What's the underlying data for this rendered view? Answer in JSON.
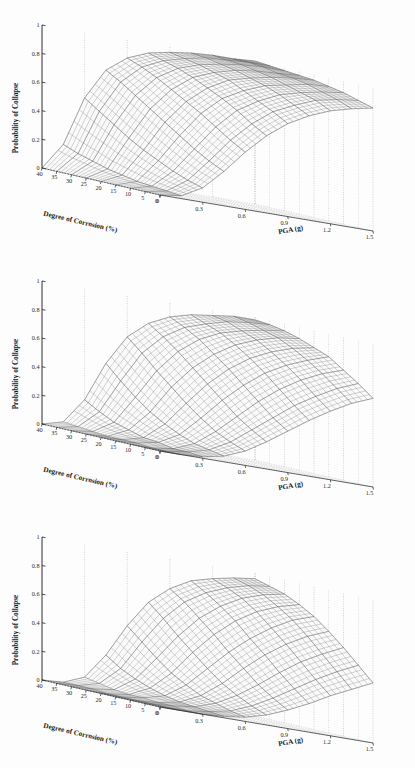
{
  "figure": {
    "background": "#fdfdfd",
    "panel_count": 3,
    "panel_height": 256
  },
  "axes_common": {
    "z": {
      "label": "Probability of Collapse",
      "ticks": [
        "0",
        "0.2",
        "0.4",
        "0.6",
        "0.8",
        "1"
      ],
      "tick_values": [
        0,
        0.2,
        0.4,
        0.6,
        0.8,
        1
      ],
      "range": [
        0,
        1
      ]
    },
    "x": {
      "label": "Degree of Corrosion (%)",
      "ticks": [
        "40",
        "35",
        "30",
        "25",
        "20",
        "15",
        "10",
        "5",
        "0"
      ],
      "tick_values": [
        40,
        35,
        30,
        25,
        20,
        15,
        10,
        5,
        0
      ],
      "range": [
        0,
        40
      ],
      "direction": "reversed"
    },
    "y": {
      "label": "PGA (g)",
      "ticks": [
        "0",
        "0.3",
        "0.6",
        "0.9",
        "1.2",
        "1.5"
      ],
      "tick_values": [
        0,
        0.3,
        0.6,
        0.9,
        1.2,
        1.5
      ],
      "range": [
        0,
        1.5
      ]
    },
    "colors": {
      "mesh_line": "#6d6d6d",
      "mesh_line_light": "#b9b9b9",
      "axis_line": "#222222",
      "grid_dotted": "#8a8a8a",
      "surface_fill": "#fafafa"
    }
  },
  "chart_data": [
    {
      "id": "panel-1",
      "type": "surface",
      "title": "",
      "xlabel": "Degree of Corrosion (%)",
      "ylabel": "PGA (g)",
      "zlabel": "Probability of Collapse",
      "xlim": [
        0,
        40
      ],
      "ylim": [
        0,
        1.5
      ],
      "zlim": [
        0,
        1
      ],
      "grid": true,
      "legend": "none",
      "x": [
        0,
        5,
        10,
        15,
        20,
        25,
        30,
        35,
        40
      ],
      "y": [
        0,
        0.15,
        0.3,
        0.45,
        0.6,
        0.75,
        0.9,
        1.05,
        1.2,
        1.35,
        1.5
      ],
      "description": "Collapse fragility surface, lowest PGA threshold; probability rises steeply and saturates near 1 at high corrosion.",
      "z": [
        [
          0.0,
          0.02,
          0.1,
          0.24,
          0.4,
          0.54,
          0.65,
          0.73,
          0.79,
          0.83,
          0.86
        ],
        [
          0.0,
          0.03,
          0.13,
          0.29,
          0.46,
          0.6,
          0.71,
          0.78,
          0.84,
          0.87,
          0.89
        ],
        [
          0.0,
          0.04,
          0.17,
          0.35,
          0.53,
          0.67,
          0.76,
          0.83,
          0.87,
          0.9,
          0.92
        ],
        [
          0.0,
          0.05,
          0.22,
          0.42,
          0.6,
          0.73,
          0.81,
          0.87,
          0.9,
          0.93,
          0.94
        ],
        [
          0.0,
          0.07,
          0.27,
          0.49,
          0.66,
          0.78,
          0.86,
          0.9,
          0.93,
          0.95,
          0.96
        ],
        [
          0.0,
          0.09,
          0.33,
          0.56,
          0.72,
          0.83,
          0.89,
          0.93,
          0.95,
          0.96,
          0.97
        ],
        [
          0.0,
          0.12,
          0.4,
          0.63,
          0.78,
          0.87,
          0.92,
          0.95,
          0.97,
          0.98,
          0.98
        ],
        [
          0.0,
          0.15,
          0.47,
          0.7,
          0.83,
          0.9,
          0.94,
          0.97,
          0.98,
          0.99,
          0.99
        ],
        [
          0.0,
          0.19,
          0.54,
          0.76,
          0.87,
          0.93,
          0.96,
          0.98,
          0.99,
          0.99,
          1.0
        ]
      ]
    },
    {
      "id": "panel-2",
      "type": "surface",
      "title": "",
      "xlabel": "Degree of Corrosion (%)",
      "ylabel": "PGA (g)",
      "zlabel": "Probability of Collapse",
      "xlim": [
        0,
        40
      ],
      "ylim": [
        0,
        1.5
      ],
      "zlim": [
        0,
        1
      ],
      "grid": true,
      "legend": "none",
      "x": [
        0,
        5,
        10,
        15,
        20,
        25,
        30,
        35,
        40
      ],
      "y": [
        0,
        0.15,
        0.3,
        0.45,
        0.6,
        0.75,
        0.9,
        1.05,
        1.2,
        1.35,
        1.5
      ],
      "description": "Collapse fragility surface, intermediate PGA threshold; onset delayed relative to panel 1.",
      "z": [
        [
          0.0,
          0.0,
          0.01,
          0.04,
          0.1,
          0.19,
          0.29,
          0.39,
          0.48,
          0.56,
          0.62
        ],
        [
          0.0,
          0.0,
          0.02,
          0.06,
          0.14,
          0.25,
          0.36,
          0.47,
          0.56,
          0.64,
          0.7
        ],
        [
          0.0,
          0.0,
          0.02,
          0.08,
          0.19,
          0.32,
          0.45,
          0.56,
          0.65,
          0.72,
          0.77
        ],
        [
          0.0,
          0.01,
          0.04,
          0.12,
          0.26,
          0.41,
          0.54,
          0.65,
          0.73,
          0.79,
          0.84
        ],
        [
          0.0,
          0.01,
          0.05,
          0.17,
          0.34,
          0.5,
          0.63,
          0.73,
          0.8,
          0.85,
          0.88
        ],
        [
          0.0,
          0.01,
          0.08,
          0.23,
          0.43,
          0.59,
          0.71,
          0.8,
          0.86,
          0.9,
          0.92
        ],
        [
          0.0,
          0.02,
          0.11,
          0.31,
          0.52,
          0.68,
          0.79,
          0.86,
          0.9,
          0.93,
          0.95
        ],
        [
          0.0,
          0.03,
          0.16,
          0.4,
          0.62,
          0.76,
          0.85,
          0.9,
          0.94,
          0.96,
          0.97
        ],
        [
          0.0,
          0.04,
          0.22,
          0.5,
          0.71,
          0.83,
          0.9,
          0.94,
          0.96,
          0.98,
          0.98
        ]
      ]
    },
    {
      "id": "panel-3",
      "type": "surface",
      "title": "",
      "xlabel": "Degree of Corrosion (%)",
      "ylabel": "PGA (g)",
      "zlabel": "Probability of Collapse",
      "xlim": [
        0,
        40
      ],
      "ylim": [
        0,
        1.5
      ],
      "zlim": [
        0,
        1
      ],
      "grid": true,
      "legend": "none",
      "x": [
        0,
        5,
        10,
        15,
        20,
        25,
        30,
        35,
        40
      ],
      "y": [
        0,
        0.15,
        0.3,
        0.45,
        0.6,
        0.75,
        0.9,
        1.05,
        1.2,
        1.35,
        1.5
      ],
      "description": "Collapse fragility surface, highest PGA threshold; lowest probabilities, narrow ridge at the far corner.",
      "z": [
        [
          0.0,
          0.0,
          0.0,
          0.01,
          0.03,
          0.07,
          0.13,
          0.2,
          0.28,
          0.35,
          0.42
        ],
        [
          0.0,
          0.0,
          0.0,
          0.02,
          0.05,
          0.11,
          0.19,
          0.28,
          0.37,
          0.45,
          0.52
        ],
        [
          0.0,
          0.0,
          0.01,
          0.03,
          0.08,
          0.16,
          0.26,
          0.37,
          0.47,
          0.55,
          0.62
        ],
        [
          0.0,
          0.0,
          0.01,
          0.04,
          0.11,
          0.22,
          0.35,
          0.47,
          0.57,
          0.65,
          0.71
        ],
        [
          0.0,
          0.0,
          0.02,
          0.06,
          0.16,
          0.3,
          0.44,
          0.56,
          0.66,
          0.74,
          0.79
        ],
        [
          0.0,
          0.0,
          0.02,
          0.09,
          0.22,
          0.39,
          0.54,
          0.66,
          0.75,
          0.81,
          0.85
        ],
        [
          0.0,
          0.01,
          0.03,
          0.13,
          0.3,
          0.48,
          0.63,
          0.74,
          0.82,
          0.87,
          0.9
        ],
        [
          0.0,
          0.01,
          0.05,
          0.18,
          0.39,
          0.58,
          0.72,
          0.81,
          0.87,
          0.91,
          0.93
        ],
        [
          0.0,
          0.01,
          0.07,
          0.25,
          0.48,
          0.67,
          0.79,
          0.87,
          0.91,
          0.94,
          0.96
        ]
      ]
    }
  ]
}
